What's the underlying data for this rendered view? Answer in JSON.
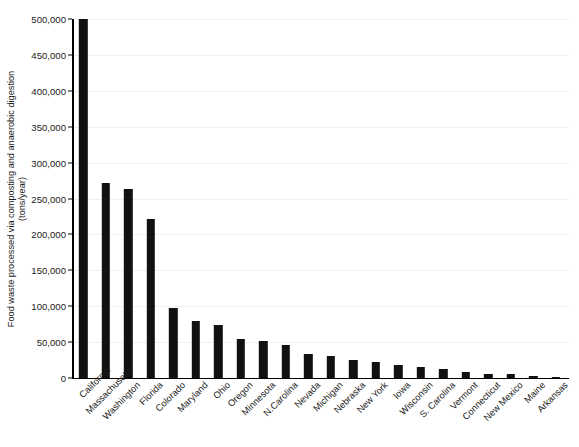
{
  "chart_data": {
    "type": "bar",
    "title": "",
    "xlabel": "",
    "ylabel": "Food waste processed via composting and anaerobic digestion (tons/year)",
    "ylabel_line1": "Food waste processed via composting and anaerobic digestion",
    "ylabel_line2": "(tons/year)",
    "ylim": [
      0,
      500000
    ],
    "grid": true,
    "legend": "none",
    "ytick_labels": [
      "0",
      "50,000",
      "100,000",
      "150,000",
      "200,000",
      "250,000",
      "300,000",
      "350,000",
      "400,000",
      "450,000",
      "500,000"
    ],
    "ytick_values": [
      0,
      50000,
      100000,
      150000,
      200000,
      250000,
      300000,
      350000,
      400000,
      450000,
      500000
    ],
    "bar_color": "#111111",
    "categories": [
      "California",
      "Massachusetts",
      "Washington",
      "Florida",
      "Colorado",
      "Maryland",
      "Ohio",
      "Oregon",
      "Minnesota",
      "N.Carolina",
      "Nevada",
      "Michigan",
      "Nebraska",
      "New York",
      "Iowa",
      "Wisconsin",
      "S. Carolina",
      "Vermont",
      "Connecticut",
      "New Mexico",
      "Maine",
      "Arkansas"
    ],
    "values": [
      500000,
      271000,
      263000,
      221000,
      98000,
      79000,
      74000,
      54000,
      51000,
      46000,
      34000,
      31000,
      25000,
      22000,
      18000,
      15000,
      12000,
      8000,
      6000,
      5000,
      3500,
      2000
    ]
  },
  "caption": {
    "text": ""
  }
}
